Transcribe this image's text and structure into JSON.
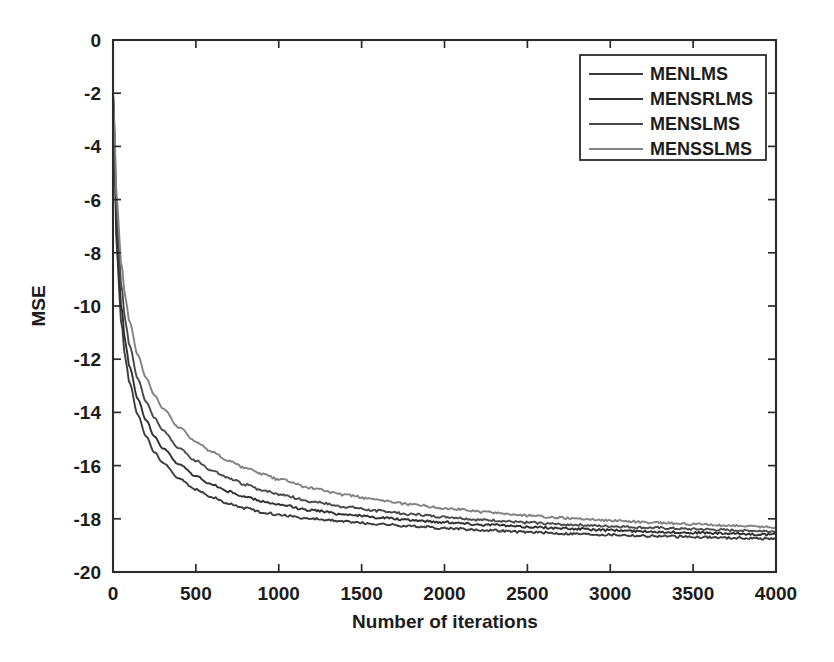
{
  "chart_data": {
    "type": "line",
    "title": "",
    "xlabel": "Number of iterations",
    "ylabel": "MSE",
    "xlim": [
      0,
      4000
    ],
    "ylim": [
      -20,
      0
    ],
    "grid": false,
    "legend_position": "top-right",
    "xticks": [
      0,
      500,
      1000,
      1500,
      2000,
      2500,
      3000,
      3500,
      4000
    ],
    "xtick_labels": [
      "0",
      "500",
      "1000",
      "1500",
      "2000",
      "2500",
      "3000",
      "3500",
      "4000"
    ],
    "yticks": [
      0,
      -2,
      -4,
      -6,
      -8,
      -10,
      -12,
      -14,
      -16,
      -18,
      -20
    ],
    "ytick_labels": [
      "0",
      "-2",
      "-4",
      "-6",
      "-8",
      "-10",
      "-12",
      "-14",
      "-16",
      "-18",
      "-20"
    ],
    "x": [
      0,
      25,
      50,
      75,
      100,
      150,
      200,
      250,
      300,
      400,
      500,
      600,
      700,
      800,
      900,
      1000,
      1200,
      1400,
      1600,
      1800,
      2000,
      2250,
      2500,
      2750,
      3000,
      3250,
      3500,
      3750,
      4000
    ],
    "series": [
      {
        "name": "MENLMS",
        "color": "#3c3c3c",
        "values": [
          -2.0,
          -8.2,
          -10.6,
          -12.0,
          -12.9,
          -14.1,
          -14.9,
          -15.5,
          -15.9,
          -16.5,
          -16.9,
          -17.2,
          -17.45,
          -17.6,
          -17.75,
          -17.85,
          -18.0,
          -18.1,
          -18.2,
          -18.28,
          -18.35,
          -18.43,
          -18.5,
          -18.56,
          -18.6,
          -18.65,
          -18.68,
          -18.72,
          -18.75
        ]
      },
      {
        "name": "MENSRLMS",
        "color": "#303030",
        "values": [
          -2.0,
          -7.6,
          -10.0,
          -11.4,
          -12.3,
          -13.5,
          -14.3,
          -14.9,
          -15.35,
          -15.95,
          -16.4,
          -16.72,
          -16.98,
          -17.18,
          -17.34,
          -17.48,
          -17.68,
          -17.83,
          -17.95,
          -18.05,
          -18.13,
          -18.22,
          -18.3,
          -18.37,
          -18.43,
          -18.48,
          -18.52,
          -18.56,
          -18.6
        ]
      },
      {
        "name": "MENSLMS",
        "color": "#4a4a4a",
        "values": [
          -2.0,
          -6.9,
          -9.2,
          -10.6,
          -11.5,
          -12.75,
          -13.6,
          -14.2,
          -14.68,
          -15.35,
          -15.82,
          -16.2,
          -16.48,
          -16.72,
          -16.92,
          -17.08,
          -17.35,
          -17.55,
          -17.7,
          -17.83,
          -17.93,
          -18.05,
          -18.14,
          -18.22,
          -18.28,
          -18.34,
          -18.39,
          -18.43,
          -18.47
        ]
      },
      {
        "name": "MENSSLMS",
        "color": "#828282",
        "values": [
          -2.0,
          -6.2,
          -8.4,
          -9.7,
          -10.6,
          -11.85,
          -12.7,
          -13.35,
          -13.85,
          -14.58,
          -15.1,
          -15.5,
          -15.83,
          -16.1,
          -16.32,
          -16.52,
          -16.85,
          -17.1,
          -17.3,
          -17.46,
          -17.6,
          -17.75,
          -17.88,
          -17.98,
          -18.06,
          -18.14,
          -18.2,
          -18.26,
          -18.32
        ]
      }
    ]
  }
}
